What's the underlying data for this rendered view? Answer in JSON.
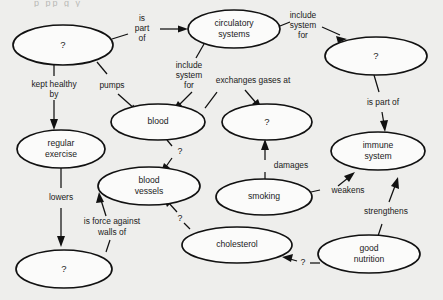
{
  "diagram": {
    "title_fragment": "p  pp  g  y",
    "type": "concept-map",
    "background_color": "#eeeeec",
    "node_fill": "#fbfbfa",
    "stroke_color": "#111111",
    "nodes": [
      {
        "id": "heart",
        "label": "?",
        "cx": 63,
        "cy": 45,
        "rx": 50,
        "ry": 20
      },
      {
        "id": "circulatory",
        "label": "circulatory systems",
        "cx": 234,
        "cy": 29,
        "rx": 46,
        "ry": 19,
        "line1": "circulatory",
        "line2": "systems"
      },
      {
        "id": "respiratory",
        "label": "?",
        "cx": 376,
        "cy": 56,
        "rx": 51,
        "ry": 19
      },
      {
        "id": "blood",
        "label": "blood",
        "cx": 158,
        "cy": 122,
        "rx": 47,
        "ry": 18
      },
      {
        "id": "lungs",
        "label": "?",
        "cx": 267,
        "cy": 122,
        "rx": 45,
        "ry": 18
      },
      {
        "id": "exercise",
        "label": "regular exercise",
        "cx": 61,
        "cy": 149,
        "rx": 44,
        "ry": 19,
        "line1": "regular",
        "line2": "exercise"
      },
      {
        "id": "immune",
        "label": "immune system",
        "cx": 378,
        "cy": 151,
        "rx": 47,
        "ry": 19,
        "line1": "immune",
        "line2": "system"
      },
      {
        "id": "vessels",
        "label": "blood vessels",
        "cx": 149,
        "cy": 186,
        "rx": 51,
        "ry": 19,
        "line1": "blood",
        "line2": "vessels"
      },
      {
        "id": "smoking",
        "label": "smoking",
        "cx": 264,
        "cy": 197,
        "rx": 48,
        "ry": 18
      },
      {
        "id": "cholesterol",
        "label": "cholesterol",
        "cx": 237,
        "cy": 245,
        "rx": 55,
        "ry": 18
      },
      {
        "id": "nutrition",
        "label": "good nutrition",
        "cx": 369,
        "cy": 254,
        "rx": 51,
        "ry": 19,
        "line1": "good",
        "line2": "nutrition"
      },
      {
        "id": "bloodpressure",
        "label": "?",
        "cx": 64,
        "cy": 269,
        "rx": 48,
        "ry": 19
      }
    ],
    "links": [
      {
        "id": "heart-circulatory",
        "from": "heart",
        "to": "circulatory",
        "label": "is part of",
        "lines": [
          "is",
          "part",
          "of"
        ],
        "lx": 142,
        "ly": 27
      },
      {
        "id": "heart-blood",
        "from": "heart",
        "to": "blood",
        "label": "pumps",
        "lines": [
          "pumps"
        ],
        "lx": 112,
        "ly": 86
      },
      {
        "id": "heart-exercise",
        "from": "heart",
        "to": "exercise",
        "label": "kept healthy by",
        "lines": [
          "kept healthy",
          "by"
        ],
        "lx": 54,
        "ly": 90
      },
      {
        "id": "circulatory-blood",
        "from": "circulatory",
        "to": "blood",
        "label": "include system for",
        "lines": [
          "include",
          "system",
          "for"
        ],
        "lx": 189,
        "ly": 77
      },
      {
        "id": "circulatory-respiratory",
        "from": "circulatory",
        "to": "respiratory",
        "label": "include system for",
        "lines": [
          "include",
          "system",
          "for"
        ],
        "lx": 300,
        "ly": 26
      },
      {
        "id": "blood-lungs",
        "from": "blood",
        "to": "lungs",
        "label": "exchanges gases at",
        "lines": [
          "exchanges gases at"
        ],
        "lx": 253,
        "ly": 81
      },
      {
        "id": "respiratory-immune",
        "from": "respiratory",
        "to": "immune",
        "label": "is part of",
        "lines": [
          "is part of"
        ],
        "lx": 383,
        "ly": 103
      },
      {
        "id": "exercise-bloodpressure",
        "from": "exercise",
        "to": "bloodpressure",
        "label": "lowers",
        "lines": [
          "lowers"
        ],
        "lx": 61,
        "ly": 199
      },
      {
        "id": "blood-vessels",
        "from": "blood",
        "to": "vessels",
        "label": "?",
        "lines": [
          "?"
        ],
        "lx": 175,
        "ly": 152
      },
      {
        "id": "bloodpressure-vessels",
        "from": "bloodpressure",
        "to": "vessels",
        "label": "is force against walls of",
        "lines": [
          "is force against",
          "walls of"
        ],
        "lx": 112,
        "ly": 224
      },
      {
        "id": "cholesterol-vessels",
        "from": "cholesterol",
        "to": "vessels",
        "label": "?",
        "lines": [
          "?"
        ],
        "lx": 179,
        "ly": 218
      },
      {
        "id": "smoking-lungs",
        "from": "smoking",
        "to": "lungs",
        "label": "damages",
        "lines": [
          "damages"
        ],
        "lx": 290,
        "ly": 166
      },
      {
        "id": "smoking-immune",
        "from": "smoking",
        "to": "immune",
        "label": "weakens",
        "lines": [
          "weakens"
        ],
        "lx": 348,
        "ly": 191
      },
      {
        "id": "nutrition-immune",
        "from": "nutrition",
        "to": "immune",
        "label": "strengthens",
        "lines": [
          "strengthens"
        ],
        "lx": 386,
        "ly": 212
      },
      {
        "id": "nutrition-cholesterol",
        "from": "nutrition",
        "to": "cholesterol",
        "label": "?",
        "lines": [
          "?"
        ],
        "lx": 302,
        "ly": 265
      }
    ]
  }
}
